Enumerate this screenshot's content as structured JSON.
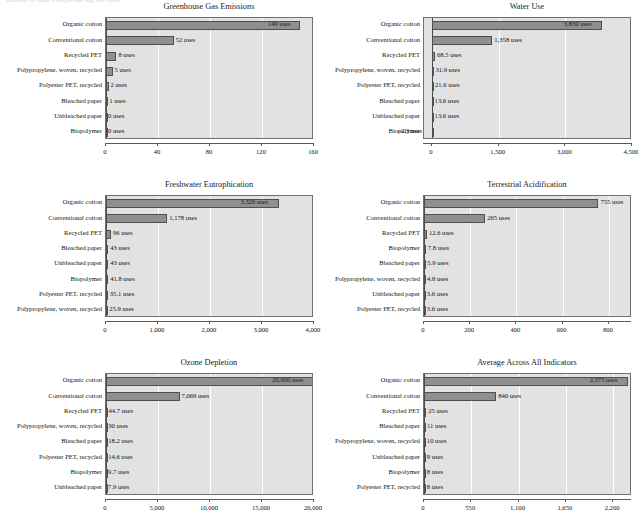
{
  "page": {
    "top_caption": "Material to make a single-use bag 149 times"
  },
  "chart_data": [
    {
      "type": "bar",
      "orientation": "horizontal",
      "title": "Greenhouse Gas Emissions",
      "xlabel": "",
      "ylabel": "",
      "xlim": [
        0,
        160
      ],
      "ticks": [
        "0",
        "40",
        "80",
        "120",
        "160"
      ],
      "tick_values": [
        0,
        40,
        80,
        120,
        160
      ],
      "grid": true,
      "unit_suffix": "uses",
      "categories": [
        "Organic cotton",
        "Conventional cotton",
        "Recycled PET",
        "Polypropylene, woven, recycled",
        "Polyester PET, recycled",
        "Bleached paper",
        "Unbleached paper",
        "Biopolymer"
      ],
      "values": [
        149,
        52,
        8,
        5,
        2,
        1,
        0,
        0
      ],
      "value_labels": [
        "149 uses",
        "52 uses",
        "8 uses",
        "5 uses",
        "2 uses",
        "1 uses",
        "0 uses",
        "0 uses"
      ]
    },
    {
      "type": "bar",
      "orientation": "horizontal",
      "title": "Water Use",
      "xlabel": "",
      "ylabel": "",
      "xlim": [
        -180,
        4500
      ],
      "ticks": [
        "0",
        "1,500",
        "3,000",
        "4,500"
      ],
      "tick_values": [
        0,
        1500,
        3000,
        4500
      ],
      "grid": true,
      "unit_suffix": "uses",
      "categories": [
        "Organic cotton",
        "Conventional cotton",
        "Recycled PET",
        "Polypropylene, woven, recycled",
        "Polyester PET, recycled",
        "Bleached paper",
        "Unbleached paper",
        "Biopolymer"
      ],
      "values": [
        3830,
        1358,
        68.5,
        31.9,
        21.6,
        13.6,
        13.6,
        -2.3
      ],
      "value_labels": [
        "3,830 uses",
        "1,358 uses",
        "68.5 uses",
        "31.9 uses",
        "21.6 uses",
        "13.6 uses",
        "13.6 uses",
        "–2.3 uses"
      ]
    },
    {
      "type": "bar",
      "orientation": "horizontal",
      "title": "Freshwater Eutrophication",
      "xlabel": "",
      "ylabel": "",
      "xlim": [
        0,
        4000
      ],
      "ticks": [
        "0",
        "1,000",
        "2,000",
        "3,000",
        "4,000"
      ],
      "tick_values": [
        0,
        1000,
        2000,
        3000,
        4000
      ],
      "grid": true,
      "unit_suffix": "uses",
      "categories": [
        "Organic cotton",
        "Conventional cotton",
        "Recycled PET",
        "Bleached paper",
        "Unbleached paper",
        "Biopolymer",
        "Polyester PET, recycled",
        "Polypropylene, woven, recycled"
      ],
      "values": [
        3326,
        1178,
        96,
        43,
        43,
        41.8,
        35.1,
        25.9
      ],
      "value_labels": [
        "3,326 uses",
        "1,178 uses",
        "96 uses",
        "43 uses",
        "43 uses",
        "41.8 uses",
        "35.1 uses",
        "25.9 uses"
      ]
    },
    {
      "type": "bar",
      "orientation": "horizontal",
      "title": "Terrestrial Acidification",
      "xlabel": "",
      "ylabel": "",
      "xlim": [
        0,
        900
      ],
      "ticks": [
        "0",
        "200",
        "400",
        "600",
        "800"
      ],
      "tick_values": [
        0,
        200,
        400,
        600,
        800
      ],
      "grid": true,
      "unit_suffix": "uses",
      "categories": [
        "Organic cotton",
        "Conventional cotton",
        "Recycled PET",
        "Biopolymer",
        "Bleached paper",
        "Polypropylene, woven, recycled",
        "Unbleached paper",
        "Polyester PET, recycled"
      ],
      "values": [
        755,
        265,
        12.6,
        7.8,
        5.9,
        4.8,
        3.6,
        3.6
      ],
      "value_labels": [
        "755 uses",
        "265 uses",
        "12.6 uses",
        "7.8 uses",
        "5.9 uses",
        "4.8 uses",
        "3.6 uses",
        "3.6 uses"
      ]
    },
    {
      "type": "bar",
      "orientation": "horizontal",
      "title": "Ozone Depletion",
      "xlabel": "",
      "ylabel": "",
      "xlim": [
        0,
        20000
      ],
      "ticks": [
        "0",
        "5,000",
        "10,000",
        "15,000",
        "20,000"
      ],
      "tick_values": [
        0,
        5000,
        10000,
        15000,
        20000
      ],
      "grid": true,
      "unit_suffix": "uses",
      "categories": [
        "Organic cotton",
        "Conventional cotton",
        "Recycled PET",
        "Polypropylene, woven, recycled",
        "Bleached paper",
        "Polyester PET, recycled",
        "Biopolymer",
        "Unbleached paper"
      ],
      "values": [
        20000,
        7069,
        44.7,
        30,
        18.2,
        14.6,
        9.7,
        7.9
      ],
      "value_labels": [
        "20,000 uses",
        "7,069 uses",
        "44.7 uses",
        "30 uses",
        "18.2 uses",
        "14.6 uses",
        "9.7 uses",
        "7.9 uses"
      ]
    },
    {
      "type": "bar",
      "orientation": "horizontal",
      "title": "Average Across All Indicators",
      "xlabel": "",
      "ylabel": "",
      "xlim": [
        0,
        2420
      ],
      "ticks": [
        "0",
        "550",
        "1,100",
        "1,650",
        "2,200"
      ],
      "tick_values": [
        0,
        550,
        1100,
        1650,
        2200
      ],
      "grid": true,
      "unit_suffix": "uses",
      "categories": [
        "Organic cotton",
        "Conventional cotton",
        "Recycled PET",
        "Bleached paper",
        "Polypropylene, woven, recycled",
        "Unbleached paper",
        "Biopolymer",
        "Polyester PET, recycled"
      ],
      "values": [
        2375,
        840,
        25,
        11,
        10,
        9,
        8,
        8
      ],
      "value_labels": [
        "2,375 uses",
        "840 uses",
        "25 uses",
        "11 uses",
        "10 uses",
        "9 uses",
        "8 uses",
        "8 uses"
      ]
    }
  ]
}
